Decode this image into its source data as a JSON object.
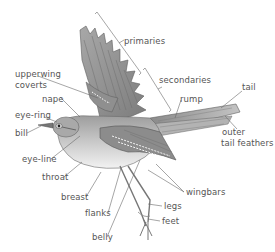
{
  "diagram": {
    "colors": {
      "ink": "#555555",
      "line": "#6a6a6a",
      "plumage": "#9a9a9a",
      "background": "#ffffff"
    },
    "labels": {
      "primaries": "primaries",
      "secondaries": "secondaries",
      "upperwing_coverts_1": "upperwing",
      "upperwing_coverts_2": "coverts",
      "nape": "nape",
      "rump": "rump",
      "tail": "tail",
      "eye_ring": "eye-ring",
      "bill": "bill",
      "outer_tail_feathers_1": "outer",
      "outer_tail_feathers_2": "tail feathers",
      "eye_line": "eye-line",
      "throat": "throat",
      "breast": "breast",
      "flanks": "flanks",
      "wingbars": "wingbars",
      "legs": "legs",
      "belly": "belly",
      "feet": "feet"
    }
  }
}
